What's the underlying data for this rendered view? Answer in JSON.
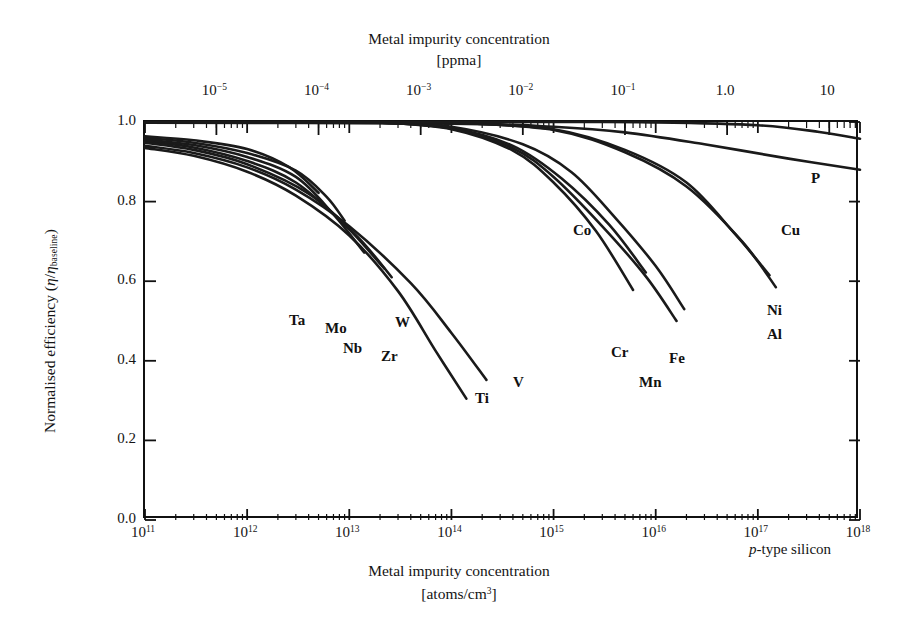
{
  "chart_data": {
    "type": "line",
    "title": "",
    "xlabel": "Metal impurity concentration",
    "xunit": "[atoms/cm3]",
    "ylabel": "Normalised efficiency",
    "ysymbol": "(η/ηbaseline)",
    "xlim": [
      100000000000.0,
      1e+18
    ],
    "ylim": [
      0.0,
      1.0
    ],
    "xscale": "log",
    "yscale": "linear",
    "grid": false,
    "legend": "inline curve end labels",
    "annotation": "p-type silicon",
    "secondary_axis": {
      "position": "top",
      "label": "Metal impurity concentration",
      "unit": "[ppma]",
      "ticks": [
        "10-5",
        "10-4",
        "10-3",
        "10-2",
        "10-1",
        "1.0",
        "10"
      ]
    },
    "x_ticks": [
      "1011",
      "1012",
      "1013",
      "1014",
      "1015",
      "1016",
      "1017",
      "1018"
    ],
    "y_ticks": [
      "0.0",
      "0.2",
      "0.4",
      "0.6",
      "0.8",
      "1.0"
    ],
    "series": [
      {
        "name": "Ti",
        "x": [
          100000000000.0,
          300000000000.0,
          1000000000000.0,
          3000000000000.0,
          10000000000000.0,
          30000000000000.0,
          70000000000000.0,
          140000000000000.0
        ],
        "values": [
          0.935,
          0.915,
          0.875,
          0.815,
          0.715,
          0.575,
          0.425,
          0.305
        ]
      },
      {
        "name": "V",
        "x": [
          100000000000.0,
          300000000000.0,
          1000000000000.0,
          3000000000000.0,
          10000000000000.0,
          40000000000000.0,
          100000000000000.0,
          220000000000000.0
        ],
        "values": [
          0.94,
          0.922,
          0.886,
          0.83,
          0.738,
          0.595,
          0.47,
          0.352
        ]
      },
      {
        "name": "Zr",
        "x": [
          100000000000.0,
          300000000000.0,
          1000000000000.0,
          3000000000000.0,
          9000000000000.0,
          22000000000000.0
        ],
        "values": [
          0.952,
          0.936,
          0.902,
          0.848,
          0.742,
          0.632
        ]
      },
      {
        "name": "Nb",
        "x": [
          100000000000.0,
          300000000000.0,
          1000000000000.0,
          3000000000000.0,
          7000000000000.0,
          14000000000000.0
        ],
        "values": [
          0.956,
          0.942,
          0.912,
          0.862,
          0.768,
          0.672
        ]
      },
      {
        "name": "W",
        "x": [
          100000000000.0,
          300000000000.0,
          1000000000000.0,
          4000000000000.0,
          12000000000000.0,
          26000000000000.0
        ],
        "values": [
          0.948,
          0.93,
          0.894,
          0.82,
          0.712,
          0.61
        ]
      },
      {
        "name": "Mo",
        "x": [
          100000000000.0,
          300000000000.0,
          1000000000000.0,
          3000000000000.0,
          6000000000000.0,
          9000000000000.0
        ],
        "values": [
          0.96,
          0.948,
          0.922,
          0.878,
          0.812,
          0.752
        ]
      },
      {
        "name": "Ta",
        "x": [
          100000000000.0,
          300000000000.0,
          1000000000000.0,
          2600000000000.0,
          5000000000000.0
        ],
        "values": [
          0.964,
          0.954,
          0.932,
          0.886,
          0.822
        ]
      },
      {
        "name": "Co",
        "x": [
          20000000000000.0,
          100000000000000.0,
          400000000000000.0,
          1200000000000000.0,
          3500000000000000.0,
          8000000000000000.0
        ],
        "values": [
          0.999,
          0.985,
          0.94,
          0.858,
          0.742,
          0.622
        ]
      },
      {
        "name": "Cr",
        "x": [
          20000000000000.0,
          100000000000000.0,
          400000000000000.0,
          1000000000000000.0,
          2600000000000000.0,
          6000000000000000.0
        ],
        "values": [
          0.999,
          0.982,
          0.928,
          0.848,
          0.726,
          0.578
        ]
      },
      {
        "name": "Mn",
        "x": [
          20000000000000.0,
          100000000000000.0,
          400000000000000.0,
          1000000000000000.0,
          3000000000000000.0,
          8000000000000000.0,
          1.6e+16
        ],
        "values": [
          0.999,
          0.984,
          0.934,
          0.862,
          0.738,
          0.612,
          0.5
        ]
      },
      {
        "name": "Fe",
        "x": [
          20000000000000.0,
          100000000000000.0,
          500000000000000.0,
          1500000000000000.0,
          4000000000000000.0,
          1e+16,
          1.9e+16
        ],
        "values": [
          0.999,
          0.988,
          0.944,
          0.874,
          0.76,
          0.638,
          0.53
        ]
      },
      {
        "name": "Ni",
        "x": [
          100000000000000.0,
          1000000000000000.0,
          5000000000000000.0,
          2e+16,
          6e+16,
          1.3e+17
        ],
        "values": [
          0.999,
          0.982,
          0.93,
          0.848,
          0.718,
          0.615
        ]
      },
      {
        "name": "Al",
        "x": [
          100000000000000.0,
          1000000000000000.0,
          5000000000000000.0,
          2e+16,
          7e+16,
          1.5e+17
        ],
        "values": [
          0.999,
          0.98,
          0.924,
          0.838,
          0.7,
          0.585
        ]
      },
      {
        "name": "Cu",
        "x": [
          100000000000.0,
          100000000000000.0,
          1000000000000000.0,
          5000000000000000.0,
          3e+16,
          2e+17,
          1e+18
        ],
        "values": [
          0.998,
          0.996,
          0.988,
          0.974,
          0.944,
          0.908,
          0.88
        ]
      },
      {
        "name": "P",
        "x": [
          100000000000.0,
          1000000000000000.0,
          1e+16,
          1e+17,
          4e+17,
          1e+18
        ],
        "values": [
          1.0,
          1.0,
          0.999,
          0.992,
          0.975,
          0.958
        ]
      }
    ]
  },
  "top_axis": {
    "title": "Metal impurity concentration",
    "unit": "[ppma]",
    "ticks": [
      {
        "label_base": "10",
        "label_sup": "−5"
      },
      {
        "label_base": "10",
        "label_sup": "−4"
      },
      {
        "label_base": "10",
        "label_sup": "−3"
      },
      {
        "label_base": "10",
        "label_sup": "−2"
      },
      {
        "label_base": "10",
        "label_sup": "−1"
      },
      {
        "label_base": "1.0",
        "label_sup": ""
      },
      {
        "label_base": "10",
        "label_sup": ""
      }
    ]
  },
  "bottom_axis": {
    "title": "Metal impurity concentration",
    "unit_pre": "[atoms/cm",
    "unit_sup": "3",
    "unit_post": "]",
    "ticks": [
      {
        "label_base": "10",
        "label_sup": "11"
      },
      {
        "label_base": "10",
        "label_sup": "12"
      },
      {
        "label_base": "10",
        "label_sup": "13"
      },
      {
        "label_base": "10",
        "label_sup": "14"
      },
      {
        "label_base": "10",
        "label_sup": "15"
      },
      {
        "label_base": "10",
        "label_sup": "16"
      },
      {
        "label_base": "10",
        "label_sup": "17"
      },
      {
        "label_base": "10",
        "label_sup": "18"
      }
    ]
  },
  "y_axis": {
    "title_pre": "Normalised efficiency (",
    "eta1": "η",
    "slash": "/",
    "eta2": "η",
    "sub": "baseline",
    "title_post": ")",
    "ticks": [
      "1.0",
      "0.8",
      "0.6",
      "0.4",
      "0.2",
      "0.0"
    ]
  },
  "curve_labels": [
    {
      "name": "Ta",
      "text": "Ta"
    },
    {
      "name": "Mo",
      "text": "Mo"
    },
    {
      "name": "Nb",
      "text": "Nb"
    },
    {
      "name": "Zr",
      "text": "Zr"
    },
    {
      "name": "W",
      "text": "W"
    },
    {
      "name": "Ti",
      "text": "Ti"
    },
    {
      "name": "V",
      "text": "V"
    },
    {
      "name": "Co",
      "text": "Co"
    },
    {
      "name": "Cr",
      "text": "Cr"
    },
    {
      "name": "Fe",
      "text": "Fe"
    },
    {
      "name": "Mn",
      "text": "Mn"
    },
    {
      "name": "Ni",
      "text": "Ni"
    },
    {
      "name": "Al",
      "text": "Al"
    },
    {
      "name": "Cu",
      "text": "Cu"
    },
    {
      "name": "P",
      "text": "P"
    }
  ],
  "annotation": {
    "italic": "p",
    "rest": "-type silicon"
  },
  "colors": {
    "ink": "#111111",
    "background": "#ffffff",
    "curve": "#1a1a1a"
  }
}
